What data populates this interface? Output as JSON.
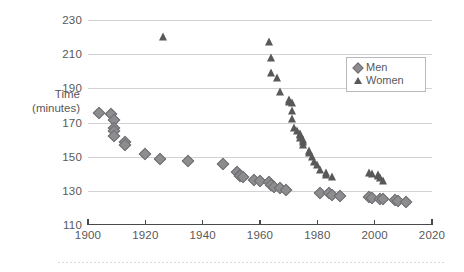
{
  "chart_data": {
    "type": "scatter",
    "title": "",
    "xlabel": "",
    "ylabel": "Time (minutes)",
    "ylabel_line1": "Time",
    "ylabel_line2": "(minutes)",
    "xlim": [
      1900,
      2020
    ],
    "ylim": [
      110,
      230
    ],
    "xticks": [
      1900,
      1920,
      1940,
      1960,
      1980,
      2000,
      2020
    ],
    "yticks": [
      110,
      130,
      150,
      170,
      190,
      210,
      230
    ],
    "grid": "horizontal",
    "legend_position": "top-right",
    "legend": [
      {
        "name": "Men",
        "marker": "diamond",
        "color": "#8d8d90"
      },
      {
        "name": "Women",
        "marker": "triangle",
        "color": "#58585a"
      }
    ],
    "series": [
      {
        "name": "Men",
        "marker": "diamond",
        "color": "#8d8d90",
        "points": [
          [
            1904,
            175.5
          ],
          [
            1908,
            175.0
          ],
          [
            1909,
            171.5
          ],
          [
            1909,
            166.5
          ],
          [
            1909,
            165.0
          ],
          [
            1909,
            162.0
          ],
          [
            1913,
            158.5
          ],
          [
            1913,
            157.0
          ],
          [
            1920,
            151.5
          ],
          [
            1925,
            148.5
          ],
          [
            1935,
            147.5
          ],
          [
            1947,
            145.5
          ],
          [
            1952,
            141.0
          ],
          [
            1953,
            139.5
          ],
          [
            1953,
            138.5
          ],
          [
            1954,
            138.0
          ],
          [
            1958,
            136.5
          ],
          [
            1960,
            135.5
          ],
          [
            1963,
            135.0
          ],
          [
            1964,
            133.5
          ],
          [
            1965,
            132.5
          ],
          [
            1967,
            131.5
          ],
          [
            1969,
            130.5
          ],
          [
            1981,
            129.0
          ],
          [
            1984,
            128.5
          ],
          [
            1985,
            127.5
          ],
          [
            1988,
            127.0
          ],
          [
            1998,
            126.5
          ],
          [
            1999,
            126.0
          ],
          [
            2002,
            125.5
          ],
          [
            2003,
            125.0
          ],
          [
            2007,
            124.5
          ],
          [
            2008,
            124.0
          ],
          [
            2011,
            123.5
          ]
        ]
      },
      {
        "name": "Women",
        "marker": "triangle",
        "color": "#58585a",
        "points": [
          [
            1926,
            220.0
          ],
          [
            1963,
            217.0
          ],
          [
            1964,
            208.0
          ],
          [
            1964,
            199.0
          ],
          [
            1966,
            196.0
          ],
          [
            1967,
            188.0
          ],
          [
            1970,
            183.0
          ],
          [
            1970,
            182.0
          ],
          [
            1971,
            181.5
          ],
          [
            1971,
            177.0
          ],
          [
            1971,
            172.0
          ],
          [
            1972,
            167.0
          ],
          [
            1973,
            165.0
          ],
          [
            1974,
            163.5
          ],
          [
            1974,
            162.5
          ],
          [
            1974,
            161.0
          ],
          [
            1975,
            159.5
          ],
          [
            1975,
            158.5
          ],
          [
            1975,
            157.0
          ],
          [
            1977,
            153.5
          ],
          [
            1977,
            152.0
          ],
          [
            1978,
            150.0
          ],
          [
            1979,
            147.0
          ],
          [
            1980,
            145.0
          ],
          [
            1981,
            142.0
          ],
          [
            1983,
            140.5
          ],
          [
            1983,
            139.5
          ],
          [
            1985,
            138.0
          ],
          [
            1998,
            140.5
          ],
          [
            1999,
            140.0
          ],
          [
            2001,
            139.5
          ],
          [
            2001,
            138.5
          ],
          [
            2002,
            137.5
          ],
          [
            2003,
            135.5
          ]
        ]
      }
    ]
  }
}
